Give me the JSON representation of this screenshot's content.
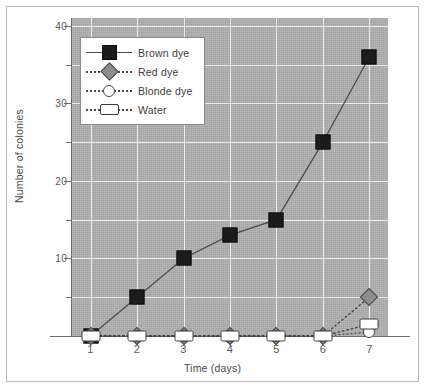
{
  "chart_data": {
    "type": "line",
    "title": "",
    "xlabel": "Time (days)",
    "ylabel": "Number of colonies",
    "x": [
      1,
      2,
      3,
      4,
      5,
      6,
      7
    ],
    "xtick_labels": [
      "1",
      "2",
      "3",
      "4",
      "5",
      "6",
      "7"
    ],
    "ytick_labels": [
      "10",
      "20",
      "30",
      "40"
    ],
    "ytick_values": [
      10,
      20,
      30,
      40
    ],
    "yminor_values": [
      5,
      15,
      25,
      35
    ],
    "xlim": [
      0.6,
      7.4
    ],
    "ylim": [
      0,
      41
    ],
    "grid": true,
    "legend_position": "upper-left-inside",
    "plot_background": "#b0b0b0",
    "gridline_color": "#ededed",
    "series": [
      {
        "name": "Brown dye",
        "marker": "filled-square",
        "marker_color": "#1c1c1c",
        "line_style": "solid",
        "values": [
          0,
          5,
          10,
          13,
          15,
          25,
          36
        ]
      },
      {
        "name": "Red dye",
        "marker": "filled-diamond",
        "marker_color": "#8e8e8e",
        "line_style": "dotted",
        "values": [
          0,
          0,
          0,
          0,
          0,
          0,
          5
        ]
      },
      {
        "name": "Blonde dye",
        "marker": "open-circle",
        "marker_color": "#ffffff",
        "line_style": "dotted",
        "values": [
          0,
          0,
          0,
          0,
          0,
          0,
          0.5
        ]
      },
      {
        "name": "Water",
        "marker": "open-rectangle",
        "marker_color": "#ffffff",
        "line_style": "dotted",
        "values": [
          0,
          0,
          0,
          0,
          0,
          0,
          1.5
        ]
      }
    ]
  },
  "legend": {
    "items": [
      {
        "label": "Brown dye"
      },
      {
        "label": "Red dye"
      },
      {
        "label": "Blonde dye"
      },
      {
        "label": "Water"
      }
    ]
  },
  "axes": {
    "x_title": "Time (days)",
    "y_title": "Number of colonies"
  }
}
